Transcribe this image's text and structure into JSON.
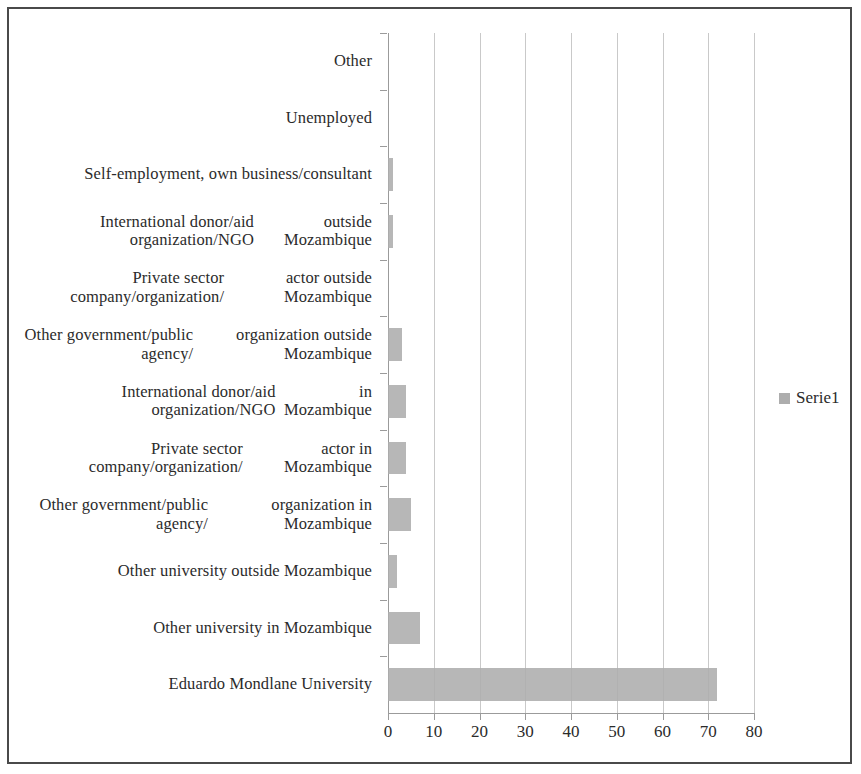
{
  "chart_data": {
    "type": "bar",
    "orientation": "horizontal",
    "title": "",
    "subtitle": "",
    "xlabel": "",
    "ylabel": "",
    "xlim": [
      0,
      80
    ],
    "xticks": [
      0,
      10,
      20,
      30,
      40,
      50,
      60,
      70,
      80
    ],
    "xtick_labels": [
      "0",
      "10",
      "20",
      "30",
      "40",
      "50",
      "60",
      "70",
      "80"
    ],
    "grid": true,
    "grid_axis": "x",
    "legend": {
      "position": "right",
      "entries": [
        {
          "name": "Serie1",
          "color": "#adadad"
        }
      ]
    },
    "series": [
      {
        "name": "Serie1",
        "color": "#adadad",
        "values": [
          72,
          7,
          2,
          5,
          4,
          4,
          3,
          0,
          1,
          1,
          0,
          0
        ]
      }
    ],
    "categories": [
      "Eduardo Mondlane University",
      "Other university in Mozambique",
      "Other university outside Mozambique",
      "Other government/public agency/ organization in Mozambique",
      "Private sector company/organization/ actor in Mozambique",
      "International donor/aid organization/NGO in Mozambique",
      "Other government/public agency/ organization outside Mozambique",
      "Private sector company/organization/ actor outside Mozambique",
      "International donor/aid organization/NGO outside Mozambique",
      "Self-employment, own business/ consultant",
      "Unemployed",
      "Other"
    ],
    "category_lines": [
      [
        "Eduardo Mondlane University"
      ],
      [
        "Other university in Mozambique"
      ],
      [
        "Other university outside Mozambique"
      ],
      [
        "Other government/public agency/",
        "organization in Mozambique"
      ],
      [
        "Private sector company/organization/",
        "actor in Mozambique"
      ],
      [
        "International donor/aid organization/NGO",
        "in Mozambique"
      ],
      [
        "Other government/public agency/",
        "organization outside Mozambique"
      ],
      [
        "Private sector company/organization/",
        "actor outside Mozambique"
      ],
      [
        "International donor/aid organization/NGO",
        "outside Mozambique"
      ],
      [
        "Self-employment, own business/",
        "consultant"
      ],
      [
        "Unemployed"
      ],
      [
        "Other"
      ]
    ]
  },
  "colors": {
    "bar": "#adadad",
    "grid": "#c9c9c9",
    "axis": "#9b9b9b",
    "text": "#2b2b2b",
    "frame": "#4a4a4a",
    "background": "#ffffff"
  }
}
